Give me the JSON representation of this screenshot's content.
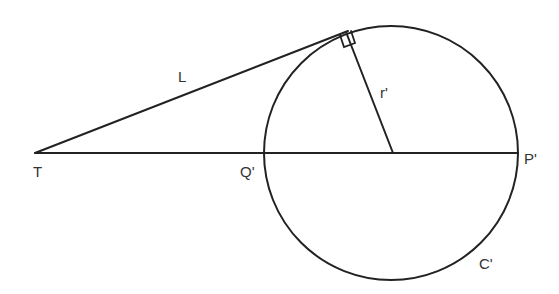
{
  "diagram": {
    "stroke_color": "#222222",
    "labels": {
      "tangent_length": "L",
      "radius": "r'",
      "external_point": "T",
      "near_intersection": "Q'",
      "far_intersection": "P'",
      "circle": "C'"
    },
    "geometry": {
      "T": [
        35,
        153
      ],
      "Q_prime": [
        263,
        153
      ],
      "P_prime": [
        518,
        153
      ],
      "center": [
        391,
        153
      ],
      "radius": 127,
      "tangent_point": [
        346,
        32
      ],
      "right_angle_marker": true
    }
  }
}
